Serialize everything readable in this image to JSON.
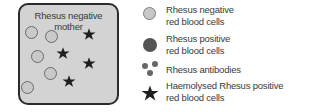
{
  "diagram": {
    "box": {
      "title_line1": "Rhesus negative",
      "title_line2": "mother",
      "fill_color": "#d3d3d3",
      "border_color": "#2b2b2b",
      "negative_cells": [
        {
          "x": 31,
          "y": 32
        },
        {
          "x": 51,
          "y": 36
        },
        {
          "x": 37,
          "y": 56
        },
        {
          "x": 50,
          "y": 73
        },
        {
          "x": 27,
          "y": 87
        }
      ],
      "haemolysed_stars": [
        {
          "x": 89,
          "y": 34
        },
        {
          "x": 63,
          "y": 53
        },
        {
          "x": 89,
          "y": 63
        },
        {
          "x": 69,
          "y": 81
        }
      ]
    },
    "legend": {
      "items": [
        {
          "icon": "rh-negative-cell-icon",
          "line1": "Rhesus negative",
          "line2": "red blood cells"
        },
        {
          "icon": "rh-positive-cell-icon",
          "line1": "Rhesus positive",
          "line2": "red blood cells"
        },
        {
          "icon": "rh-antibodies-icon",
          "line1": "Rhesus antibodies",
          "line2": ""
        },
        {
          "icon": "haemolysed-star-icon",
          "line1": "Haemolysed Rhesus positive",
          "line2": "red blood cells"
        }
      ]
    }
  }
}
